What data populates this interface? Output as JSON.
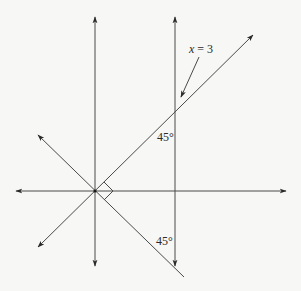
{
  "diagram": {
    "type": "coordinate-geometry",
    "background": "#f7f7f5",
    "stroke_color": "#4a4a4a",
    "origin": {
      "x": 95,
      "y": 191
    },
    "labels": {
      "line_label_eq": "x = 3",
      "line_label_x": "x",
      "line_label_rest": " = 3",
      "angle_upper": "45°",
      "angle_lower": "45°"
    },
    "elements": [
      {
        "name": "x-axis",
        "description": "horizontal axis with arrows at both ends"
      },
      {
        "name": "y-axis",
        "description": "vertical axis with arrows at both ends"
      },
      {
        "name": "vertical-line-x-equals-3",
        "description": "vertical line x = 3 with arrows at both ends"
      },
      {
        "name": "diagonal-line-positive-slope",
        "description": "line through origin at 45° rising to the right"
      },
      {
        "name": "diagonal-line-negative-slope",
        "description": "line through origin at 45° falling to the right"
      },
      {
        "name": "right-angle-marker",
        "description": "square marking right angle between the two diagonals at origin"
      },
      {
        "name": "pointer-arrow",
        "description": "arrow from label x = 3 to vertical line"
      }
    ]
  }
}
